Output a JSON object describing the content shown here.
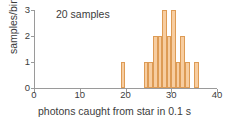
{
  "chart_data": {
    "type": "bar",
    "title": "",
    "annotation": "20 samples",
    "xlabel": "photons caught from star in 0.1 s",
    "ylabel": "samples/bin",
    "xlim": [
      0,
      40
    ],
    "ylim": [
      0,
      3
    ],
    "xticks": [
      0,
      10,
      20,
      30,
      40
    ],
    "xticklabels": [
      "0",
      "10",
      "20",
      "30",
      "40"
    ],
    "yticks": [
      0,
      1,
      2,
      3
    ],
    "yticklabels": [
      "0",
      "1",
      "2",
      "3"
    ],
    "grid": false,
    "legend": null,
    "bin_width": 1,
    "categories": [
      19,
      24,
      25,
      26,
      27,
      28,
      29,
      30,
      31,
      32,
      33,
      35
    ],
    "values": [
      1,
      1,
      1,
      2,
      2,
      3,
      2,
      3,
      1,
      2,
      1,
      1
    ],
    "total_samples": 20,
    "bar_fill": "#f7cda0",
    "bar_stroke": "#dd9b55",
    "axis_color": "#9a9a9a",
    "text_color": "#3c3c3c"
  }
}
